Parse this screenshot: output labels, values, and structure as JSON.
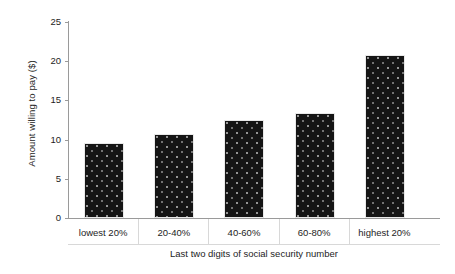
{
  "chart_data": {
    "type": "bar",
    "title": "",
    "categories": [
      "lowest 20%",
      "20-40%",
      "40-60%",
      "60-80%",
      "highest 20%"
    ],
    "values": [
      9.6,
      10.7,
      12.5,
      13.4,
      20.8
    ],
    "xlabel": "Last two digits of social security number",
    "ylabel": "Amount willing to pay ($)",
    "ylim": [
      0,
      25
    ],
    "yticks": [
      0,
      5,
      10,
      15,
      20,
      25
    ],
    "ytick_labels": [
      "0",
      "5",
      "10",
      "15",
      "20",
      "25"
    ],
    "grid": false,
    "legend": null,
    "bar_color": "#151515",
    "axis_color": "#9a9a9a",
    "background": "#ffffff"
  }
}
